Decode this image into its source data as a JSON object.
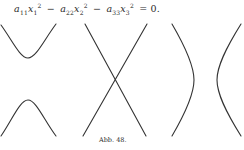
{
  "equation": {
    "t1_coef": "a",
    "t1_coef_sub": "11",
    "t1_var": "x",
    "t1_var_sub": "1",
    "t1_pow": "2",
    "op1": "−",
    "t2_coef": "a",
    "t2_coef_sub": "22",
    "t2_var": "x",
    "t2_var_sub": "2",
    "t2_pow": "2",
    "op2": "−",
    "t3_coef": "a",
    "t3_coef_sub": "33",
    "t3_var": "x",
    "t3_var_sub": "3",
    "t3_pow": "2",
    "rhs": "= 0."
  },
  "figure": {
    "panels": [
      {
        "name": "hyperbola-vertical-opening",
        "description": "two branches opening up and down"
      },
      {
        "name": "degenerate-crossing-lines",
        "description": "two lines crossing"
      },
      {
        "name": "hyperbola-horizontal-opening",
        "description": "two branches opening left and right"
      }
    ],
    "stroke_color": "#333333"
  },
  "caption": "Abb. 48."
}
